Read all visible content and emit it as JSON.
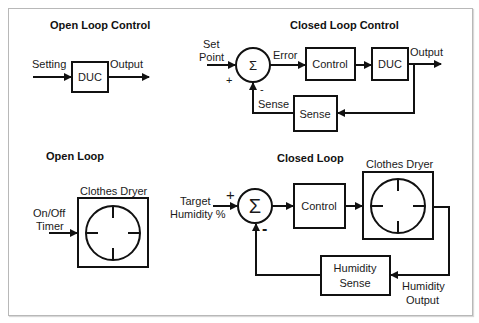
{
  "open_loop_control": {
    "title": "Open Loop Control",
    "input_label": "Setting",
    "block_label": "DUC",
    "output_label": "Output"
  },
  "closed_loop_control": {
    "title": "Closed Loop Control",
    "input_label_line1": "Set",
    "input_label_line2": "Point",
    "summer_symbol": "Σ",
    "plus_sign": "+",
    "minus_sign": "-",
    "error_label": "Error",
    "control_block": "Control",
    "plant_block": "DUC",
    "output_label": "Output",
    "sense_block": "Sense",
    "feedback_label": "Sense"
  },
  "open_loop": {
    "title": "Open Loop",
    "input_label_line1": "On/Off",
    "input_label_line2": "Timer",
    "plant_label": "Clothes Dryer"
  },
  "closed_loop": {
    "title": "Closed Loop",
    "input_label_line1": "Target",
    "input_label_line2": "Humidity %",
    "summer_symbol": "Σ",
    "plus_sign": "+",
    "minus_sign": "-",
    "control_block": "Control",
    "plant_label": "Clothes Dryer",
    "sense_block_line1": "Humidity",
    "sense_block_line2": "Sense",
    "output_label_line1": "Humidity",
    "output_label_line2": "Output"
  }
}
